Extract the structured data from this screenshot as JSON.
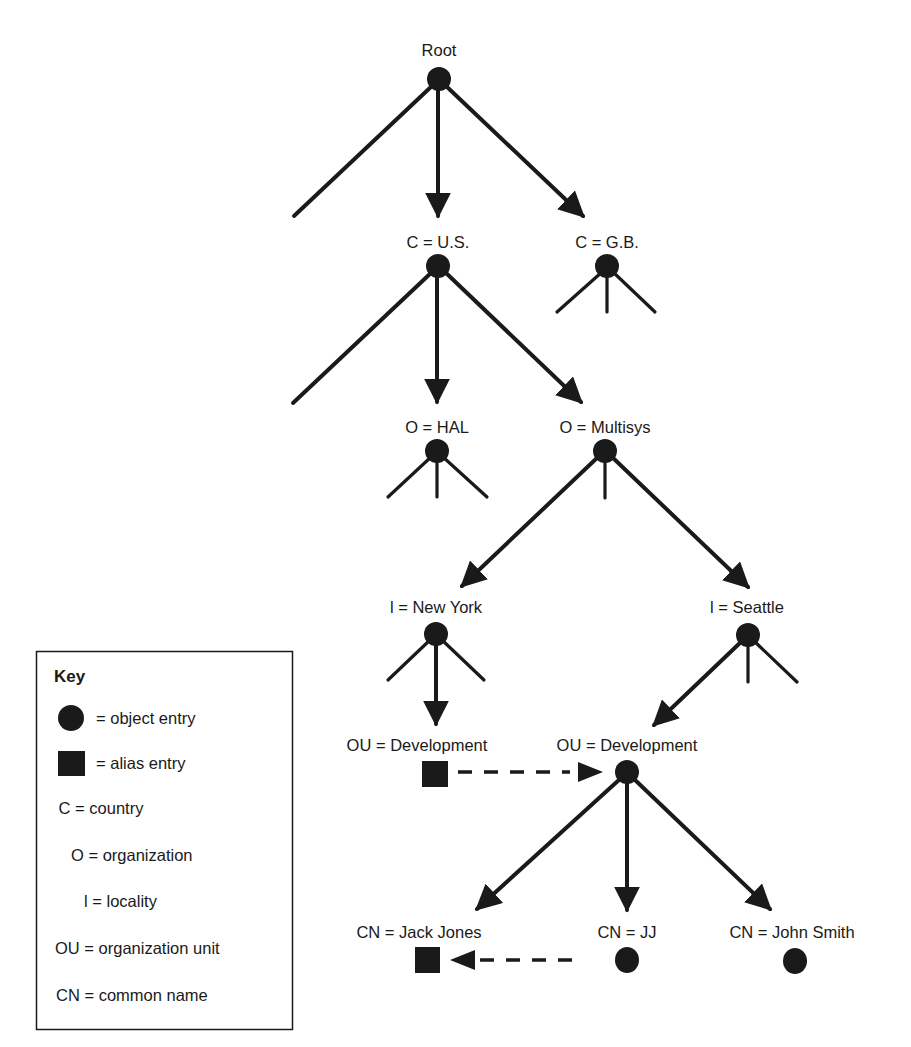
{
  "diagram": {
    "type": "directory-information-tree",
    "nodes": [
      {
        "id": "root",
        "label": "Root",
        "kind": "object"
      },
      {
        "id": "us",
        "label": "C = U.S.",
        "kind": "object"
      },
      {
        "id": "gb",
        "label": "C = G.B.",
        "kind": "object"
      },
      {
        "id": "hal",
        "label": "O = HAL",
        "kind": "object"
      },
      {
        "id": "multisys",
        "label": "O = Multisys",
        "kind": "object"
      },
      {
        "id": "newyork",
        "label": "l = New York",
        "kind": "object"
      },
      {
        "id": "seattle",
        "label": "l = Seattle",
        "kind": "object"
      },
      {
        "id": "ou_ny",
        "label": "OU = Development",
        "kind": "alias"
      },
      {
        "id": "ou_sea",
        "label": "OU = Development",
        "kind": "object"
      },
      {
        "id": "jackjones",
        "label": "CN = Jack Jones",
        "kind": "alias"
      },
      {
        "id": "jj",
        "label": "CN = JJ",
        "kind": "object"
      },
      {
        "id": "johnsmith",
        "label": "CN = John Smith",
        "kind": "object"
      }
    ],
    "edges": [
      {
        "from": "root",
        "to": "us",
        "style": "solid-arrow"
      },
      {
        "from": "root",
        "to": "gb",
        "style": "solid-arrow"
      },
      {
        "from": "us",
        "to": "hal",
        "style": "solid-arrow"
      },
      {
        "from": "us",
        "to": "multisys",
        "style": "solid-arrow"
      },
      {
        "from": "multisys",
        "to": "newyork",
        "style": "solid-arrow"
      },
      {
        "from": "multisys",
        "to": "seattle",
        "style": "solid-arrow"
      },
      {
        "from": "newyork",
        "to": "ou_ny",
        "style": "solid-arrow"
      },
      {
        "from": "seattle",
        "to": "ou_sea",
        "style": "solid-arrow"
      },
      {
        "from": "ou_ny",
        "to": "ou_sea",
        "style": "dashed-arrow"
      },
      {
        "from": "ou_sea",
        "to": "jackjones",
        "style": "solid-arrow"
      },
      {
        "from": "ou_sea",
        "to": "jj",
        "style": "solid-arrow"
      },
      {
        "from": "ou_sea",
        "to": "johnsmith",
        "style": "solid-arrow"
      },
      {
        "from": "jj",
        "to": "jackjones",
        "style": "dashed-arrow"
      }
    ]
  },
  "key": {
    "title": "Key",
    "items": [
      {
        "symbol": "circle",
        "text": "= object entry"
      },
      {
        "symbol": "square",
        "text": "= alias entry"
      },
      {
        "abbr": "C",
        "text": "C = country"
      },
      {
        "abbr": "O",
        "text": "O = organization"
      },
      {
        "abbr": "l",
        "text": "l = locality"
      },
      {
        "abbr": "OU",
        "text": "OU = organization unit"
      },
      {
        "abbr": "CN",
        "text": "CN = common name"
      }
    ]
  },
  "colors": {
    "ink": "#1a1a1a",
    "background": "#ffffff"
  }
}
